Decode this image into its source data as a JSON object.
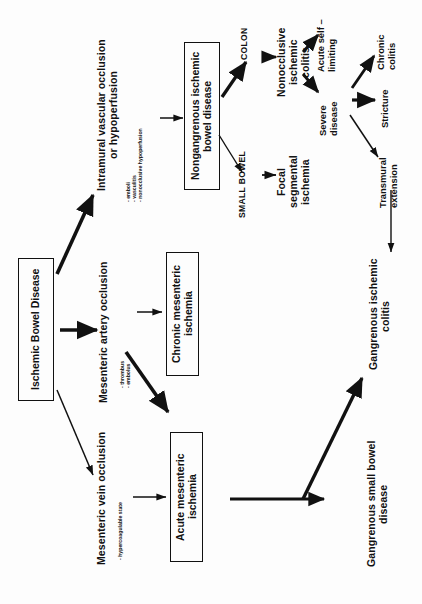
{
  "diagram": {
    "orientation": "rotated-90-ccw",
    "root": {
      "label": "Ischemic Bowel Disease"
    },
    "causes": [
      {
        "label": "Intramural vascular occlusion\nor hypoperfusion",
        "sublist": "- emboli\n- vasculitis\n- nonocclusive hypoperfusion"
      },
      {
        "label": "Mesenteric artery occlusion",
        "sublist": "- thrombus\n- embolus"
      },
      {
        "label": "Mesenteric vein occlusion",
        "sublist": "- hypercoagulable state"
      }
    ],
    "boxes": [
      {
        "label": "Nongangrenous ischemic\nbowel disease"
      },
      {
        "label": "Chronic mesenteric\nischemia"
      },
      {
        "label": "Acute mesenteric\nischemia"
      }
    ],
    "segments": [
      {
        "label": "COLON",
        "outcome": "Nonocclusive\nischemic\ncolitis"
      },
      {
        "label": "SMALL BOWEL",
        "outcome": "Focal\nsegmental\nischemia"
      }
    ],
    "colitis_course": [
      {
        "label": "Acute self –\nlimiting"
      },
      {
        "label": "Severe\ndisease"
      }
    ],
    "severe_outcomes": [
      {
        "label": "Chronic\ncolitis"
      },
      {
        "label": "Stricture"
      },
      {
        "label": "Transmural\nextension"
      }
    ],
    "terminal": [
      {
        "label": "Gangrenous ischemic\ncolitis"
      },
      {
        "label": "Gangrenous small bowel\ndisease"
      }
    ],
    "colors": {
      "ink": "#111111",
      "background": "#fdfdfd",
      "box_border": "#111111"
    }
  }
}
